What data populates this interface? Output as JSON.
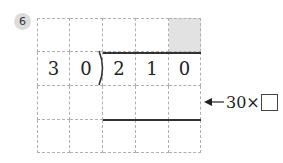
{
  "problem": {
    "number": "6",
    "divisor": [
      "3",
      "0"
    ],
    "dividend": [
      "2",
      "1",
      "0"
    ],
    "grid": {
      "rows": 4,
      "cols": 5,
      "shaded_cell": {
        "row": 1,
        "col": 5
      },
      "cells": [
        [
          "",
          "",
          "",
          "",
          ""
        ],
        [
          "3",
          "0",
          "2",
          "1",
          "0"
        ],
        [
          "",
          "",
          "",
          "",
          ""
        ],
        [
          "",
          "",
          "",
          "",
          ""
        ]
      ]
    },
    "annotation": {
      "text": "30×",
      "points_to_row": 3
    },
    "colors": {
      "badge_bg": "#dcdcdc",
      "shaded_cell": "#e2e2e2",
      "grid_line": "#b0b0b0",
      "rule_line": "#333333"
    }
  }
}
